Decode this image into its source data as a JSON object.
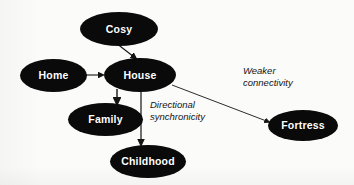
{
  "diagram": {
    "background_color": "#fbfbfa",
    "node_color": "#0a0a0a",
    "node_text_color": "#ffffff",
    "edge_color": "#141414",
    "nodes": [
      {
        "id": "cosy",
        "label": "Cosy",
        "x": 80,
        "y": 12,
        "w": 78,
        "h": 34
      },
      {
        "id": "home",
        "label": "Home",
        "x": 20,
        "y": 59,
        "w": 67,
        "h": 33
      },
      {
        "id": "house",
        "label": "House",
        "x": 104,
        "y": 58,
        "w": 72,
        "h": 34
      },
      {
        "id": "family",
        "label": "Family",
        "x": 68,
        "y": 103,
        "w": 75,
        "h": 33
      },
      {
        "id": "childhood",
        "label": "Childhood",
        "x": 110,
        "y": 145,
        "w": 76,
        "h": 33
      },
      {
        "id": "fortress",
        "label": "Fortress",
        "x": 268,
        "y": 110,
        "w": 70,
        "h": 31
      }
    ],
    "edges": [
      {
        "id": "cosy-house",
        "from": "cosy",
        "to": "house",
        "label": ""
      },
      {
        "id": "home-house",
        "from": "home",
        "to": "house",
        "label": ""
      },
      {
        "id": "house-family",
        "from": "house",
        "to": "family",
        "label": ""
      },
      {
        "id": "house-childhood",
        "from": "house",
        "to": "childhood",
        "label": "Directional\nsynchronicity"
      },
      {
        "id": "house-fortress",
        "from": "house",
        "to": "fortress",
        "label": "Weaker\nconnectivity"
      }
    ],
    "labels": {
      "directional_synchronicity": "Directional\nsynchronicity",
      "weaker_connectivity": "Weaker\nconnectivity"
    }
  }
}
